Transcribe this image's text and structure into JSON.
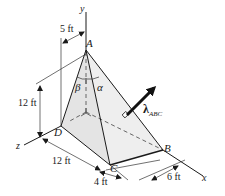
{
  "figure": {
    "points": {
      "A": "A",
      "B": "B",
      "C": "C",
      "D": "D"
    },
    "axes": {
      "x": "x",
      "y": "y",
      "z": "z"
    },
    "angles": {
      "alpha": "α",
      "beta": "β"
    },
    "unit_vector": {
      "symbol": "λ",
      "subscript": "ABC"
    },
    "dimensions": {
      "top_offset": "5 ft",
      "height": "12 ft",
      "z_length": "12 ft",
      "c_offset": "4 ft",
      "b_offset": "6 ft"
    },
    "colors": {
      "line": "#1a1a1a",
      "face_light": "#ececec",
      "face_mid": "#dcdcdc"
    }
  }
}
